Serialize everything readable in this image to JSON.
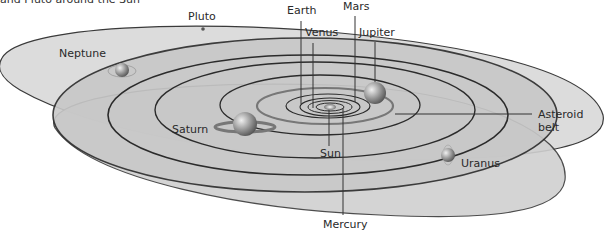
{
  "caption": "and Pluto around the Sun",
  "labels": {
    "pluto": "Pluto",
    "neptune": "Neptune",
    "earth": "Earth",
    "venus": "Venus",
    "mars": "Mars",
    "jupiter": "Jupiter",
    "asteroid_belt_line1": "Asteroid",
    "asteroid_belt_line2": "belt",
    "saturn": "Saturn",
    "sun": "Sun",
    "uranus": "Uranus",
    "mercury": "Mercury"
  },
  "colors": {
    "plane_outer": "#d6d6d6",
    "plane_mid": "#c4c4c4",
    "orbit_line": "#2b2b2b",
    "leader_line": "#333333",
    "text": "#2a2a2a"
  }
}
